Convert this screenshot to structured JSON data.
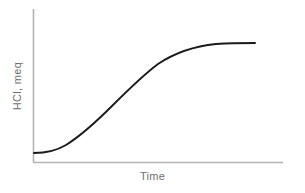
{
  "chart_data": {
    "type": "line",
    "title": "",
    "xlabel": "Time",
    "ylabel": "HCl, meq",
    "grid": false,
    "legend": null,
    "xlim": [
      0,
      1
    ],
    "ylim": [
      0,
      1
    ],
    "xticks": [],
    "yticks": [],
    "axis_color": "#b3b3b3",
    "curve_color": "#1a1a1a",
    "label_color": "#6e6e6e",
    "background_color": "#ffffff",
    "series": [
      {
        "name": "HCl secretion",
        "shape": "sigmoid",
        "x": [
          0.0,
          0.06,
          0.12,
          0.18,
          0.24,
          0.3,
          0.36,
          0.42,
          0.48,
          0.55,
          0.61,
          0.67,
          0.73,
          0.79,
          0.85,
          0.91,
          1.0
        ],
        "y": [
          0.02,
          0.02,
          0.04,
          0.07,
          0.12,
          0.2,
          0.3,
          0.41,
          0.52,
          0.63,
          0.71,
          0.78,
          0.83,
          0.87,
          0.9,
          0.92,
          0.94
        ],
        "path": "M 34 153 C 46 153 56 151 66 145 C 82 135 96 122 112 106 C 128 90 142 76 158 64 C 176 52 196 46 216 44 C 232 43 246 43 255 43"
      }
    ],
    "geometry": {
      "y_axis_x": 33,
      "y_axis_top": 9,
      "y_axis_bottom": 162,
      "x_axis_y": 162,
      "x_axis_left": 33,
      "x_axis_right": 283
    }
  },
  "figure": {
    "xlabel": "Time",
    "ylabel": "HCl, meq"
  }
}
